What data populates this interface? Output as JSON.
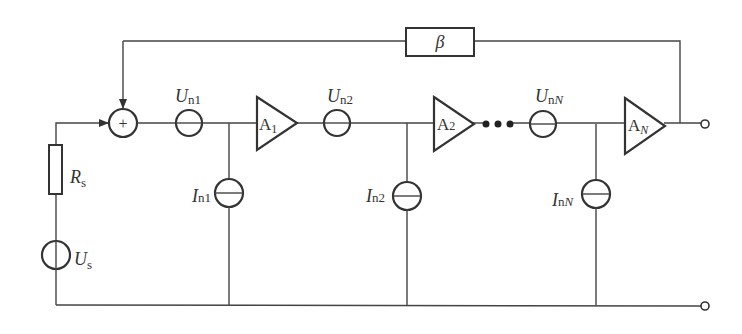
{
  "diagram": {
    "colors": {
      "line": "#444444",
      "background": "#ffffff"
    },
    "feedback": {
      "label": "β"
    },
    "summing_node": {
      "symbol": "+"
    },
    "source": {
      "resistor": {
        "main": "R",
        "sub": "s"
      },
      "voltage": {
        "main": "U",
        "sub": "s"
      }
    },
    "voltage_noise": [
      {
        "main": "U",
        "sub": "n1",
        "sub_italic": ""
      },
      {
        "main": "U",
        "sub": "n2",
        "sub_italic": ""
      },
      {
        "main": "U",
        "sub": "n",
        "sub_italic": "N"
      }
    ],
    "current_noise": [
      {
        "main": "I",
        "sub": "n1",
        "sub_italic": ""
      },
      {
        "main": "I",
        "sub": "n2",
        "sub_italic": ""
      },
      {
        "main": "I",
        "sub": "n",
        "sub_italic": "N"
      }
    ],
    "amplifiers": [
      {
        "main": "A",
        "sub": "1",
        "sub_italic": ""
      },
      {
        "main": "A",
        "sub": "2",
        "sub_italic": ""
      },
      {
        "main": "A",
        "sub": "",
        "sub_italic": "N"
      }
    ],
    "ellipsis": "• • •"
  }
}
